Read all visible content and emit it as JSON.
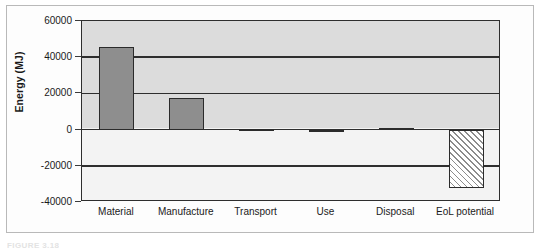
{
  "figure": {
    "caption": "FIGURE 3.18",
    "frame_color": "#b9b9b9",
    "plot_border_color": "#2e2e2e",
    "positive_background": "#dcdcdc",
    "negative_background": "#f3f3f3"
  },
  "chart_data": {
    "type": "bar",
    "title": "",
    "subtitle": "",
    "xlabel": "",
    "ylabel": "Energy (MJ)",
    "categories": [
      "Material",
      "Manufacture",
      "Transport",
      "Use",
      "Disposal",
      "EoL potential"
    ],
    "values": [
      45500,
      17500,
      500,
      0,
      1000,
      -32500
    ],
    "ylim": [
      -40000,
      60000
    ],
    "yticks": [
      60000,
      40000,
      20000,
      0,
      -20000,
      -40000
    ],
    "ytick_labels": [
      "60000",
      "40000",
      "20000",
      "0",
      "-20000",
      "-40000"
    ],
    "grid": true,
    "legend": false,
    "legend_position": "none",
    "bar_styles": [
      "solid",
      "solid",
      "solid",
      "solid",
      "solid",
      "hatched"
    ],
    "bar_fill_color": "#8e8e8e",
    "bar_edge_color": "#2b2b2b",
    "hatch_pattern": "diagonal-45",
    "hatch_fill_color": "#ffffff",
    "zero_line": 0
  }
}
